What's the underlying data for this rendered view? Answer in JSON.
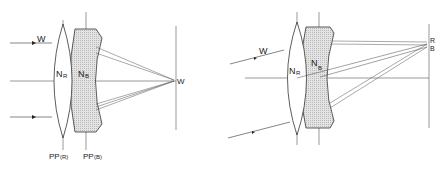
{
  "left_diagram": {
    "ray_label": "W",
    "focus_label": "W",
    "nodal_front": "N",
    "nodal_front_sub": "R",
    "nodal_rear": "N",
    "nodal_rear_sub": "B",
    "pp_front": "PP",
    "pp_front_sub": "(R)",
    "pp_rear": "PP",
    "pp_rear_sub": "(B)"
  },
  "right_diagram": {
    "ray_label": "W",
    "nodal_front": "N",
    "nodal_front_sub": "R",
    "nodal_rear": "N",
    "nodal_rear_sub": "B",
    "focus_label_red": "R",
    "focus_label_blue": "B"
  },
  "colors": {
    "line": "#333333",
    "lens_fill": "#d8d8d8",
    "background": "#ffffff"
  }
}
